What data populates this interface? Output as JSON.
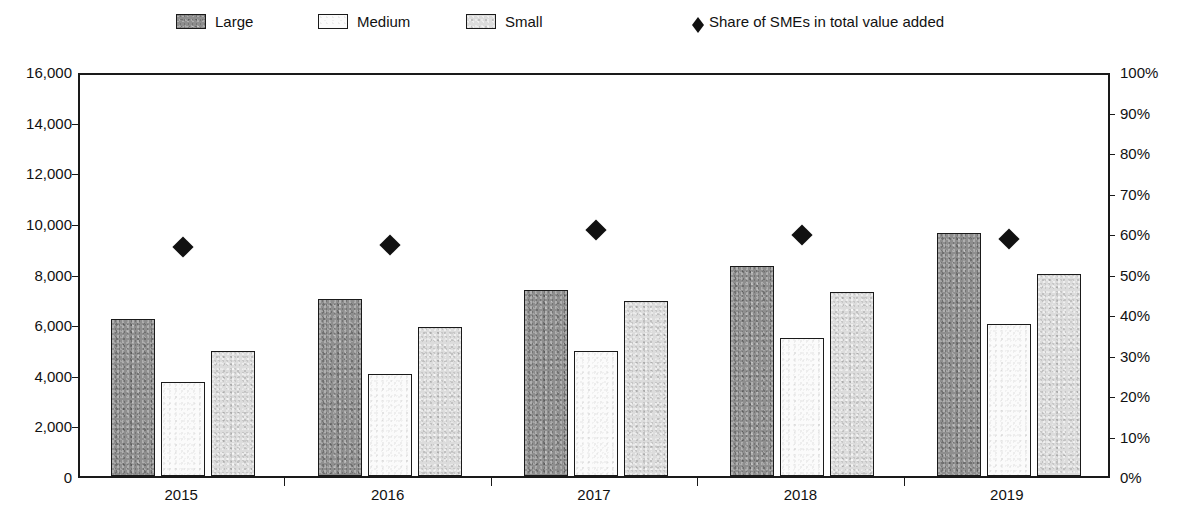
{
  "legend": {
    "items": [
      {
        "label": "Large",
        "swatch": "dark-gray-textured",
        "icon": "square-swatch-icon",
        "x": 176
      },
      {
        "label": "Medium",
        "swatch": "white",
        "icon": "square-swatch-icon",
        "x": 318
      },
      {
        "label": "Small",
        "swatch": "light-gray-textured",
        "icon": "square-swatch-icon",
        "x": 466
      },
      {
        "label": "Share of SMEs in total value added",
        "swatch": "black-diamond",
        "icon": "diamond-marker-icon",
        "x": 692
      }
    ]
  },
  "axes": {
    "left": {
      "ticks": [
        "16,000",
        "14,000",
        "12,000",
        "10,000",
        "8,000",
        "6,000",
        "4,000",
        "2,000",
        "0"
      ],
      "min": 0,
      "max": 16000,
      "step": 2000
    },
    "right": {
      "ticks": [
        "100%",
        "90%",
        "80%",
        "70%",
        "60%",
        "50%",
        "40%",
        "30%",
        "20%",
        "10%",
        "0%"
      ],
      "min": 0,
      "max": 100,
      "step": 10
    },
    "x": {
      "categories": [
        "2015",
        "2016",
        "2017",
        "2018",
        "2019"
      ]
    }
  },
  "colors": {
    "large": "#8e8e8e",
    "medium": "#fbfbfb",
    "small": "#dcdcdc",
    "marker": "#111111",
    "axis": "#1a1a1a",
    "background": "#ffffff"
  },
  "chart_data": {
    "type": "bar",
    "title": "",
    "subtitle": "",
    "xlabel": "",
    "ylabel": "",
    "categories": [
      "2015",
      "2016",
      "2017",
      "2018",
      "2019"
    ],
    "ylim": [
      0,
      16000
    ],
    "y2lim": [
      0,
      100
    ],
    "grid": false,
    "legend_position": "top",
    "series": [
      {
        "name": "Large",
        "axis": "left",
        "kind": "bar",
        "values": [
          6200,
          7000,
          7350,
          8280,
          9600
        ]
      },
      {
        "name": "Medium",
        "axis": "left",
        "kind": "bar",
        "values": [
          3700,
          4030,
          4950,
          5450,
          6000
        ]
      },
      {
        "name": "Small",
        "axis": "left",
        "kind": "bar",
        "values": [
          4920,
          5870,
          6900,
          7250,
          8000
        ]
      },
      {
        "name": "Share of SMEs in total value added",
        "axis": "right",
        "kind": "marker",
        "values": [
          57.5,
          58.0,
          61.7,
          60.6,
          59.4
        ]
      }
    ]
  }
}
